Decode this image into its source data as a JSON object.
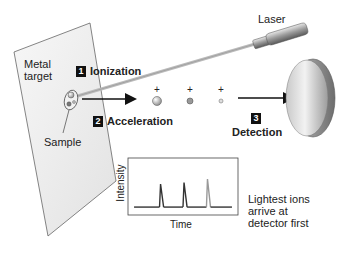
{
  "labels": {
    "laser": "Laser",
    "metal_target": [
      "Metal",
      "target"
    ],
    "sample": "Sample"
  },
  "steps": [
    {
      "number": "1",
      "label": "Ionization"
    },
    {
      "number": "2",
      "label": "Acceleration"
    },
    {
      "number": "3",
      "label": "Detection"
    }
  ],
  "ions": [
    {
      "charge": "+",
      "size": "large"
    },
    {
      "charge": "+",
      "size": "medium"
    },
    {
      "charge": "+",
      "size": "small"
    }
  ],
  "colors": {
    "plate": "#ededed",
    "outline": "#555555",
    "badge": "#111111",
    "peak_dark": "#333333",
    "peak_light": "#999999"
  },
  "inset_chart": {
    "ylabel": "Intensity",
    "xlabel": "Time",
    "note": [
      "Lightest ions",
      "arrive at",
      "detector first"
    ]
  },
  "chart_data": {
    "type": "line",
    "title": "",
    "xlabel": "Time",
    "ylabel": "Intensity",
    "grid": false,
    "legend": "none",
    "xlim": [
      0,
      100
    ],
    "ylim": [
      0,
      100
    ],
    "series": [
      {
        "name": "peak-1",
        "peak_x": 28,
        "height": 55
      },
      {
        "name": "peak-2",
        "peak_x": 51,
        "height": 58
      },
      {
        "name": "peak-3",
        "peak_x": 74,
        "height": 65
      }
    ],
    "baseline": 8
  }
}
